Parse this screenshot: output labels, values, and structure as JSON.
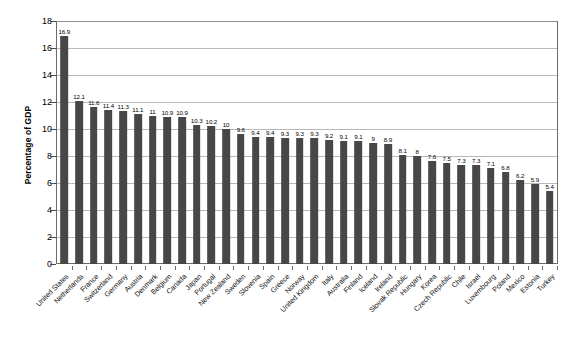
{
  "chart_data": {
    "type": "bar",
    "title": "",
    "subtitle": "",
    "xlabel": "",
    "ylabel": "Percentage of GDP",
    "ylim": [
      0,
      18
    ],
    "ytick_step": 2,
    "yticks": [
      0,
      2,
      4,
      6,
      8,
      10,
      12,
      14,
      16,
      18
    ],
    "grid": "horizontal",
    "legend": "none",
    "bar_color": "#474747",
    "axis_color": "#6b6b6b",
    "gridline_color": "#b8b8b8",
    "categories": [
      "United States",
      "Netherlands",
      "France",
      "Switzerland",
      "Germany",
      "Austria",
      "Denmark",
      "Belgium",
      "Canada",
      "Japan",
      "Portugal",
      "New Zealand",
      "Sweden",
      "Slovenia",
      "Spain",
      "Greece",
      "Norway",
      "United Kingdom",
      "Italy",
      "Australia",
      "Finland",
      "Iceland",
      "Ireland",
      "Slovak Republic",
      "Hungary",
      "Korea",
      "Czech Republic",
      "Chile",
      "Israel",
      "Luxembourg",
      "Poland",
      "Mexico",
      "Estonia",
      "Turkey"
    ],
    "values": [
      16.9,
      12.1,
      11.6,
      11.4,
      11.3,
      11.1,
      11,
      10.9,
      10.9,
      10.3,
      10.2,
      10,
      9.6,
      9.4,
      9.4,
      9.3,
      9.3,
      9.3,
      9.2,
      9.1,
      9.1,
      9,
      8.9,
      8.1,
      8,
      7.6,
      7.5,
      7.3,
      7.3,
      7.1,
      6.8,
      6.2,
      5.9,
      5.4
    ],
    "value_labels": [
      "16.9",
      "12.1",
      "11.6",
      "11.4",
      "11.3",
      "11.1",
      "11",
      "10.9",
      "10.9",
      "10.3",
      "10.2",
      "10",
      "9.6",
      "9.4",
      "9.4",
      "9.3",
      "9.3",
      "9.3",
      "9.2",
      "9.1",
      "9.1",
      "9",
      "8.9",
      "8.1",
      "8",
      "7.6",
      "7.5",
      "7.3",
      "7.3",
      "7.1",
      "6.8",
      "6.2",
      "5.9",
      "5.4"
    ]
  }
}
